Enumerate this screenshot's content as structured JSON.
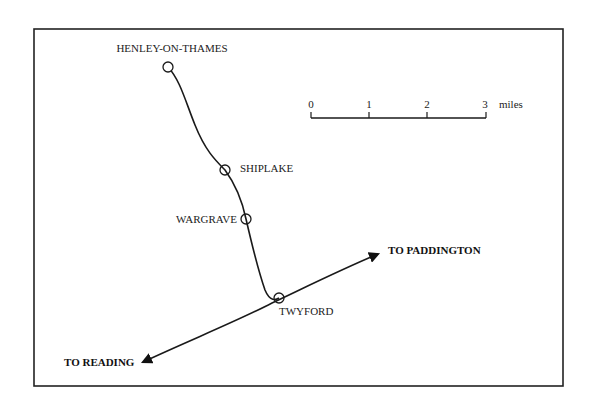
{
  "map": {
    "frame": {
      "x": 34,
      "y": 29,
      "width": 529,
      "height": 357
    },
    "line_color": "#1a1a1a",
    "stations": [
      {
        "name": "HENLEY-ON-THAMES",
        "x": 168,
        "y": 67,
        "label_x": 172,
        "label_y": 52,
        "anchor": "middle"
      },
      {
        "name": "SHIPLAKE",
        "x": 225,
        "y": 170,
        "label_x": 240,
        "label_y": 168,
        "anchor": "start"
      },
      {
        "name": "WARGRAVE",
        "x": 246,
        "y": 219,
        "label_x": 237,
        "label_y": 222,
        "anchor": "end"
      },
      {
        "name": "TWYFORD",
        "x": 279,
        "y": 298,
        "label_x": 279,
        "label_y": 315,
        "anchor": "start"
      }
    ],
    "destinations": [
      {
        "name": "TO PADDINGTON",
        "x": 388,
        "y": 256
      },
      {
        "name": "TO READING",
        "x": 64,
        "y": 366
      }
    ],
    "scale_bar": {
      "ticks": [
        "0",
        "1",
        "2",
        "3"
      ],
      "unit": "miles",
      "x0": 311,
      "x1": 486,
      "y": 116
    }
  }
}
